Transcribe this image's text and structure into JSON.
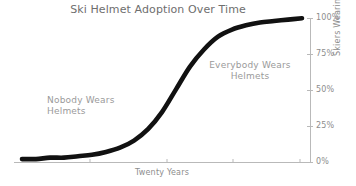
{
  "chart_data": {
    "type": "line",
    "title": "Ski Helmet Adoption Over Time",
    "xlabel": "Twenty Years",
    "ylabel": "Skiers Wearing Helmets",
    "style": "hand-drawn sigmoid curve",
    "line_color": "#111111",
    "text_color": "#8d8d8d",
    "title_color": "#6e6e6e",
    "grid": false,
    "legend": null,
    "y_axis_position": "right",
    "xlim": [
      0,
      20
    ],
    "ylim": [
      0,
      100
    ],
    "yticks": [
      0,
      25,
      50,
      75,
      100
    ],
    "ytick_labels": [
      "0%",
      "25%",
      "50%",
      "75%",
      "100%"
    ],
    "xticks": [
      5,
      10,
      15,
      20
    ],
    "xtick_labels": [
      "",
      "",
      "",
      ""
    ],
    "series": [
      {
        "name": "Skiers Wearing Helmets",
        "x": [
          0,
          1,
          2,
          3,
          4,
          5,
          6,
          7,
          8,
          9,
          10,
          11,
          12,
          13,
          14,
          15,
          16,
          17,
          18,
          19,
          20
        ],
        "values": [
          1,
          1,
          2,
          2,
          3,
          4,
          6,
          9,
          14,
          22,
          34,
          50,
          66,
          78,
          87,
          92,
          95,
          97,
          98,
          99,
          100
        ]
      }
    ],
    "annotations": [
      {
        "name": "nobody-wears-helmets",
        "text": "Nobody Wears\nHelmets",
        "x": 2.2,
        "y": 44,
        "align": "left"
      },
      {
        "name": "everybody-wears-helmets",
        "text": "Everybody Wears\nHelmets",
        "x": 13.0,
        "y": 72,
        "align": "center"
      }
    ]
  }
}
